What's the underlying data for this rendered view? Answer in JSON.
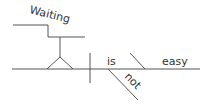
{
  "diagram": {
    "type": "sentence-diagram",
    "line_color": "#555555",
    "text_color": "#333333",
    "words": {
      "subject_gerund": "Waiting",
      "verb": "is",
      "modifier": "not",
      "complement": "easy"
    }
  }
}
